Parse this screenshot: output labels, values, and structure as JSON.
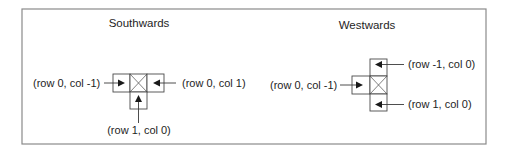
{
  "diagram": {
    "panels": [
      {
        "title": "Southwards",
        "labels": {
          "left": "(row 0, col -1)",
          "right": "(row 0, col 1)",
          "bottom": "(row 1, col 0)"
        }
      },
      {
        "title": "Westwards",
        "labels": {
          "top": "(row -1, col 0)",
          "left": "(row 0, col -1)",
          "bottom": "(row 1, col 0)"
        }
      }
    ],
    "colors": {
      "frame": "#8a8a8a",
      "cell_stroke": "#4a4a4a",
      "arrow": "#1a1a1a",
      "text": "#1e1e1e",
      "background": "#ffffff"
    }
  }
}
